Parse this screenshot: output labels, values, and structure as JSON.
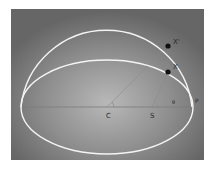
{
  "diagram": {
    "type": "orbital-geometry",
    "colors": {
      "background": "#ffffff",
      "panel_edge": "#6a6a6a",
      "panel_center": "#b4b4b4",
      "curve": "#f4f4f4",
      "construction_line": "#8a8a8a",
      "point": "#111111",
      "label": "#2b2b2b"
    },
    "labels": {
      "x_prime": "X'",
      "x": "X",
      "p": "P",
      "c": "C",
      "s": "S",
      "angle_center": "",
      "angle_focus": "θ"
    },
    "points": {
      "C": [
        107,
        107
      ],
      "S": [
        152,
        107
      ],
      "P": [
        192,
        107
      ],
      "X_prime": [
        168,
        46
      ],
      "X": [
        168,
        72
      ]
    },
    "ellipse": {
      "cx": 107,
      "cy": 107,
      "rx": 86,
      "ry": 47
    },
    "aux_circle_upper": {
      "cx": 107,
      "cy": 107,
      "r": 86
    }
  }
}
